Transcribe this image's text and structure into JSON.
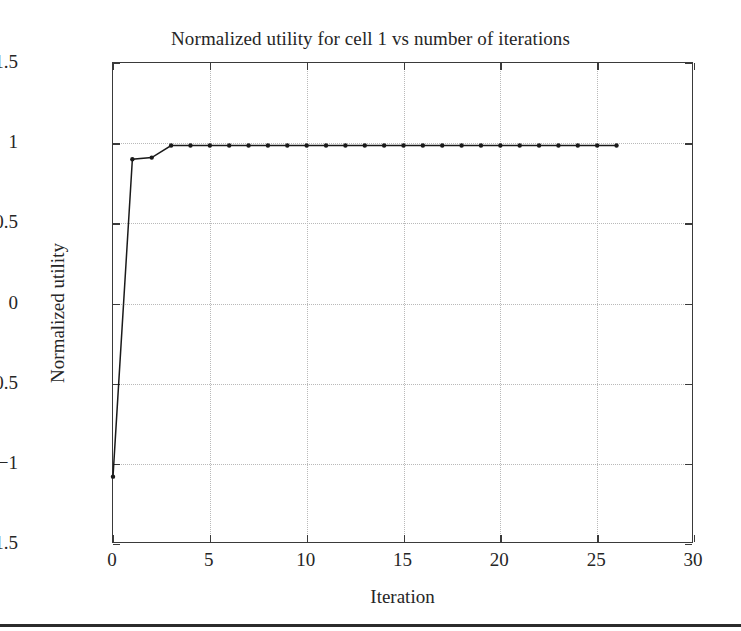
{
  "chart_data": {
    "type": "line",
    "title": "Normalized utility for cell 1 vs number of iterations",
    "xlabel": "Iteration",
    "ylabel": "Normalized utility",
    "xlim": [
      0,
      30
    ],
    "ylim": [
      -1.5,
      1.5
    ],
    "xticks": [
      0,
      5,
      10,
      15,
      20,
      25,
      30
    ],
    "xtick_labels": [
      "0",
      "5",
      "10",
      "15",
      "20",
      "25",
      "30"
    ],
    "yticks": [
      -1.5,
      -1,
      -0.5,
      0,
      0.5,
      1,
      1.5
    ],
    "ytick_labels": [
      "−1.5",
      "−1",
      "−0.5",
      "0",
      "0.5",
      "1",
      "1.5"
    ],
    "grid": true,
    "grid_style": "dotted",
    "legend": null,
    "line_color": "#1a1a1a",
    "marker": "dot",
    "series": [
      {
        "name": "Normalized utility for cell 1",
        "x": [
          0,
          1,
          2,
          3,
          4,
          5,
          6,
          7,
          8,
          9,
          10,
          11,
          12,
          13,
          14,
          15,
          16,
          17,
          18,
          19,
          20,
          21,
          22,
          23,
          24,
          25,
          26
        ],
        "values": [
          -1.08,
          0.9,
          0.91,
          0.985,
          0.985,
          0.985,
          0.985,
          0.985,
          0.985,
          0.985,
          0.985,
          0.985,
          0.985,
          0.985,
          0.985,
          0.985,
          0.985,
          0.985,
          0.985,
          0.985,
          0.985,
          0.985,
          0.985,
          0.985,
          0.985,
          0.985,
          0.985
        ]
      }
    ]
  }
}
